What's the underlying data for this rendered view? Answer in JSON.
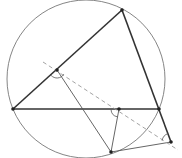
{
  "diagram": {
    "colors": {
      "background": "#ffffff",
      "triangle": "#333333",
      "circle": "#777777",
      "perp": "#555555",
      "dashed": "#999999",
      "point": "#222222"
    },
    "circle": {
      "cx": 86,
      "cy": 79,
      "r": 79
    },
    "points": {
      "A": [
        122,
        10
      ],
      "B": [
        13,
        109
      ],
      "C": [
        159,
        109
      ],
      "P": [
        111,
        152
      ],
      "D": [
        57,
        70
      ],
      "E": [
        119,
        109
      ],
      "F": [
        171,
        142
      ]
    },
    "dashed_line": {
      "from": [
        43,
        62
      ],
      "to": [
        178,
        150
      ]
    }
  }
}
